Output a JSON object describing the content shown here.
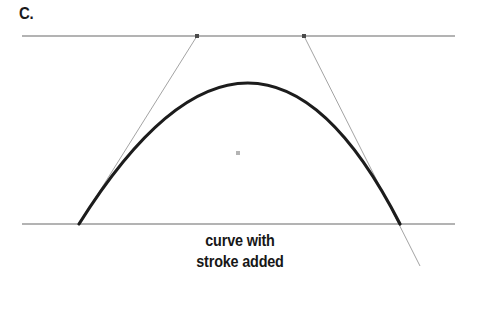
{
  "figure": {
    "label": "C.",
    "caption_line_1": "curve with",
    "caption_line_2": "stroke added",
    "colors": {
      "guide_line": "#9a9a9a",
      "curve_stroke": "#1c1c1c",
      "tangent_line": "#8c8c8c",
      "control_point": "#4a4a4a",
      "center_dot": "#b4b4b4",
      "background": "#ffffff",
      "text": "#171717"
    },
    "geometry": {
      "top_guide_line": {
        "x1": 22,
        "y1": 36,
        "x2": 455,
        "y2": 36
      },
      "bottom_guide_line": {
        "x1": 22,
        "y1": 224,
        "x2": 455,
        "y2": 224
      },
      "curve": {
        "start": {
          "x": 79,
          "y": 224
        },
        "control_1": {
          "x": 197,
          "y": 36
        },
        "control_2": {
          "x": 304,
          "y": 36
        },
        "end": {
          "x": 400,
          "y": 224
        },
        "apex": {
          "x": 245,
          "y": 85
        },
        "stroke_width": 3.2
      },
      "tangent_left": {
        "x1": 79,
        "y1": 224,
        "x2": 197,
        "y2": 36
      },
      "tangent_right": {
        "x1": 304,
        "y1": 36,
        "x2": 420,
        "y2": 266
      },
      "control_point_left": {
        "x": 197,
        "y": 36,
        "size": 4
      },
      "control_point_right": {
        "x": 304,
        "y": 36,
        "size": 4
      },
      "center_dot": {
        "x": 238,
        "y": 153,
        "size": 4
      }
    }
  }
}
